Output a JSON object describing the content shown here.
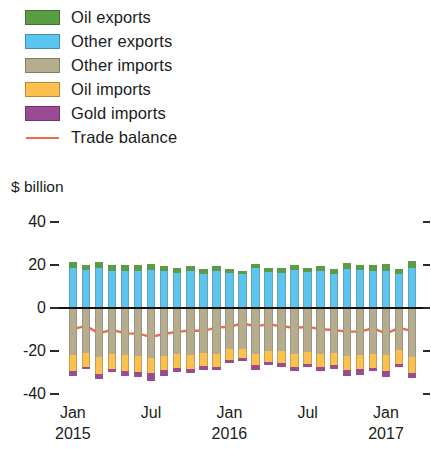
{
  "legend": {
    "items": [
      {
        "label": "Oil exports",
        "color": "#5a9e43",
        "type": "swatch",
        "name": "legend-oil-exports"
      },
      {
        "label": "Other exports",
        "color": "#5cc5ef",
        "type": "swatch",
        "name": "legend-other-exports"
      },
      {
        "label": "Other imports",
        "color": "#b5ad8e",
        "type": "swatch",
        "name": "legend-other-imports"
      },
      {
        "label": "Oil imports",
        "color": "#fcc04e",
        "type": "swatch",
        "name": "legend-oil-imports"
      },
      {
        "label": "Gold imports",
        "color": "#9c4a93",
        "type": "swatch",
        "name": "legend-gold-imports"
      },
      {
        "label": "Trade balance",
        "color": "#f2694a",
        "type": "line",
        "name": "legend-trade-balance"
      }
    ]
  },
  "axis_title": "$ billion",
  "chart_data": {
    "type": "bar",
    "title": "",
    "subtitle": "",
    "xlabel": "",
    "ylabel": "$ billion",
    "ylim": [
      -40,
      40
    ],
    "yticks": [
      40,
      20,
      0,
      -20,
      -40
    ],
    "ytick_labels": [
      "40",
      "20",
      "0",
      "-20",
      "-40"
    ],
    "grid": false,
    "legend_position": "top-left",
    "stacked": true,
    "zero_line": true,
    "x": [
      "Jan 2015",
      "Feb 2015",
      "Mar 2015",
      "Apr 2015",
      "May 2015",
      "Jun 2015",
      "Jul 2015",
      "Aug 2015",
      "Sep 2015",
      "Oct 2015",
      "Nov 2015",
      "Dec 2015",
      "Jan 2016",
      "Feb 2016",
      "Mar 2016",
      "Apr 2016",
      "May 2016",
      "Jun 2016",
      "Jul 2016",
      "Aug 2016",
      "Sep 2016",
      "Oct 2016",
      "Nov 2016",
      "Dec 2016",
      "Jan 2017",
      "Feb 2017",
      "Mar 2017"
    ],
    "xtick_labels": [
      {
        "month": "Jan",
        "year": "2015",
        "index": 0
      },
      {
        "month": "Jul",
        "year": "",
        "index": 6
      },
      {
        "month": "Jan",
        "year": "2016",
        "index": 12
      },
      {
        "month": "Jul",
        "year": "",
        "index": 18
      },
      {
        "month": "Jan",
        "year": "2017",
        "index": 24
      }
    ],
    "series": [
      {
        "name": "Other exports",
        "color": "#5cc5ef",
        "direction": "up",
        "values": [
          18.6,
          17.5,
          18.4,
          17.2,
          17.2,
          17.4,
          17.6,
          17.0,
          16.4,
          17.4,
          16.0,
          17.4,
          16.1,
          16.0,
          18.4,
          16.6,
          16.4,
          17.6,
          16.6,
          17.0,
          16.0,
          18.0,
          17.6,
          17.2,
          17.4,
          15.8,
          18.8
        ]
      },
      {
        "name": "Oil exports",
        "color": "#5a9e43",
        "direction": "up",
        "values": [
          3.0,
          2.4,
          3.0,
          2.6,
          2.6,
          2.6,
          3.0,
          2.3,
          2.2,
          2.2,
          2.0,
          2.3,
          1.8,
          1.4,
          2.0,
          2.2,
          2.3,
          2.4,
          2.2,
          2.5,
          2.2,
          2.7,
          2.4,
          2.6,
          2.9,
          2.4,
          2.9
        ]
      },
      {
        "name": "Other imports",
        "color": "#b5ad8e",
        "direction": "down",
        "values": [
          22.0,
          21.0,
          23.0,
          21.5,
          22.0,
          22.5,
          23.2,
          22.4,
          21.6,
          21.8,
          21.0,
          21.6,
          19.2,
          19.0,
          21.4,
          19.8,
          20.0,
          21.2,
          20.4,
          21.6,
          20.8,
          22.2,
          22.0,
          21.4,
          22.0,
          19.6,
          23.0
        ]
      },
      {
        "name": "Oil imports",
        "color": "#fcc04e",
        "direction": "down",
        "values": [
          7.4,
          6.2,
          7.6,
          6.8,
          7.4,
          7.4,
          7.2,
          6.6,
          6.2,
          6.4,
          6.0,
          5.8,
          4.8,
          4.4,
          5.2,
          5.2,
          5.6,
          6.0,
          5.6,
          5.8,
          5.8,
          6.4,
          6.4,
          6.6,
          7.2,
          6.4,
          7.4
        ]
      },
      {
        "name": "Gold imports",
        "color": "#9c4a93",
        "direction": "down",
        "values": [
          2.0,
          1.0,
          2.6,
          1.6,
          2.2,
          2.0,
          3.6,
          2.4,
          1.8,
          2.0,
          1.6,
          1.4,
          1.6,
          1.2,
          2.2,
          1.4,
          1.6,
          2.0,
          1.6,
          2.0,
          1.8,
          3.0,
          2.6,
          1.2,
          3.0,
          1.4,
          2.0
        ]
      }
    ],
    "line_series": {
      "name": "Trade balance",
      "color": "#f2694a",
      "values": [
        -9.8,
        -8.3,
        -11.8,
        -10.1,
        -11.8,
        -11.9,
        -13.4,
        -12.1,
        -11.0,
        -10.6,
        -10.6,
        -9.1,
        -8.7,
        -7.2,
        -8.4,
        -7.6,
        -8.5,
        -9.2,
        -8.8,
        -9.9,
        -10.2,
        -11.0,
        -11.0,
        -9.4,
        -11.9,
        -9.2,
        -10.7
      ]
    }
  }
}
